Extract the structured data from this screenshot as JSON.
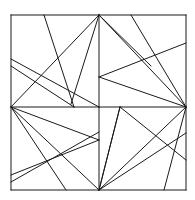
{
  "figure": {
    "type": "line-art",
    "background_color": "#ffffff",
    "stroke_color": "#1a1a1a",
    "stroke_width": 1,
    "canvas": {
      "width": 195,
      "height": 200
    },
    "frame": {
      "name": "outer-square",
      "left": 11,
      "top": 15,
      "right": 186,
      "bottom": 190
    },
    "vertices": [
      {
        "name": "top-left-corner",
        "x": 11,
        "y": 15
      },
      {
        "name": "top-center-hub",
        "x": 99,
        "y": 15
      },
      {
        "name": "top-right-corner",
        "x": 186,
        "y": 15
      },
      {
        "name": "left-mid-hub",
        "x": 11,
        "y": 107
      },
      {
        "name": "center-vertical-upper",
        "x": 99,
        "y": 68
      },
      {
        "name": "center-cross",
        "x": 99,
        "y": 107
      },
      {
        "name": "right-mid-hub",
        "x": 186,
        "y": 107
      },
      {
        "name": "center-vertical-lower",
        "x": 99,
        "y": 140
      },
      {
        "name": "bottom-left-corner",
        "x": 11,
        "y": 190
      },
      {
        "name": "bottom-center-hub",
        "x": 99,
        "y": 190
      },
      {
        "name": "bottom-right-corner",
        "x": 186,
        "y": 190
      }
    ],
    "segments": [
      {
        "name": "frame-top",
        "x1": 11,
        "y1": 15,
        "x2": 186,
        "y2": 15
      },
      {
        "name": "frame-right",
        "x1": 186,
        "y1": 15,
        "x2": 186,
        "y2": 190
      },
      {
        "name": "frame-bottom",
        "x1": 186,
        "y1": 190,
        "x2": 11,
        "y2": 190
      },
      {
        "name": "frame-left",
        "x1": 11,
        "y1": 190,
        "x2": 11,
        "y2": 15
      },
      {
        "name": "median-horizontal",
        "x1": 11,
        "y1": 107,
        "x2": 186,
        "y2": 107
      },
      {
        "name": "median-vertical-upper",
        "x1": 99,
        "y1": 15,
        "x2": 99,
        "y2": 107
      },
      {
        "name": "median-vertical-lower",
        "x1": 99,
        "y1": 107,
        "x2": 99,
        "y2": 190
      },
      {
        "name": "seg-tl-diag-down",
        "x1": 44,
        "y1": 15,
        "x2": 74,
        "y2": 107
      },
      {
        "name": "seg-tl-left-to-hubtop",
        "x1": 11,
        "y1": 66,
        "x2": 74,
        "y2": 107
      },
      {
        "name": "seg-tl-hub-to-lowleft",
        "x1": 99,
        "y1": 15,
        "x2": 71,
        "y2": 104
      },
      {
        "name": "seg-tl-hub-to-leftmid",
        "x1": 99,
        "y1": 15,
        "x2": 11,
        "y2": 107
      },
      {
        "name": "seg-tl-leftedge-to-midv",
        "x1": 11,
        "y1": 59,
        "x2": 99,
        "y2": 107
      },
      {
        "name": "seg-tr-hub-to-rightedge",
        "x1": 99,
        "y1": 15,
        "x2": 151,
        "y2": 66
      },
      {
        "name": "seg-tr-diag-to-rightmid",
        "x1": 131,
        "y1": 15,
        "x2": 186,
        "y2": 107
      },
      {
        "name": "seg-tr-rightedge-to-centerv",
        "x1": 186,
        "y1": 43,
        "x2": 99,
        "y2": 77
      },
      {
        "name": "seg-tr-centerv-to-rightmid",
        "x1": 99,
        "y1": 77,
        "x2": 186,
        "y2": 107
      },
      {
        "name": "seg-tr-hub-to-bottomright",
        "x1": 99,
        "y1": 15,
        "x2": 186,
        "y2": 107
      },
      {
        "name": "seg-bl-hub-to-centerv",
        "x1": 11,
        "y1": 107,
        "x2": 99,
        "y2": 140
      },
      {
        "name": "seg-bl-centerv-to-leftedge",
        "x1": 99,
        "y1": 140,
        "x2": 11,
        "y2": 175
      },
      {
        "name": "seg-bl-hub-to-bottomcenter",
        "x1": 11,
        "y1": 107,
        "x2": 99,
        "y2": 190
      },
      {
        "name": "seg-bl-hub-to-bottomedge",
        "x1": 11,
        "y1": 107,
        "x2": 66,
        "y2": 190
      },
      {
        "name": "seg-bl-leftedge-diag",
        "x1": 11,
        "y1": 182,
        "x2": 99,
        "y2": 132
      },
      {
        "name": "seg-br-centerv-to-bottomcenter",
        "x1": 120,
        "y1": 107,
        "x2": 99,
        "y2": 190
      },
      {
        "name": "seg-br-bottomcenter-to-peak",
        "x1": 99,
        "y1": 190,
        "x2": 120,
        "y2": 107
      },
      {
        "name": "seg-br-rightmid-to-bottomedge",
        "x1": 186,
        "y1": 107,
        "x2": 164,
        "y2": 190
      },
      {
        "name": "seg-br-peak-to-rightedge",
        "x1": 120,
        "y1": 107,
        "x2": 186,
        "y2": 160
      },
      {
        "name": "seg-br-bottomcenter-to-rightedge",
        "x1": 99,
        "y1": 190,
        "x2": 186,
        "y2": 133
      },
      {
        "name": "seg-br-rightmid-to-bottomcenter",
        "x1": 186,
        "y1": 107,
        "x2": 99,
        "y2": 190
      }
    ]
  }
}
